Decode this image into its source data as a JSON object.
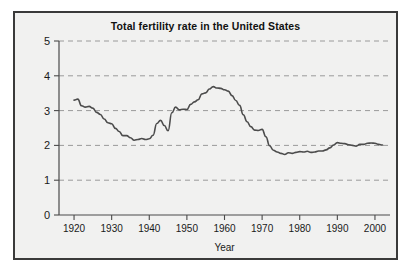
{
  "figure": {
    "title": "Total fertility rate in the United States",
    "background_color": "#f1f1f0",
    "border_color": "#3a3a3a",
    "line_color": "#4c4c4c",
    "grid_color": "#9a9a9a"
  },
  "chart_data": {
    "type": "line",
    "title": "Total fertility rate in the United States",
    "xlabel": "Year",
    "ylabel": "",
    "xlim": [
      1916,
      2004
    ],
    "ylim": [
      0,
      5
    ],
    "grid": true,
    "legend": "none",
    "xticks": [
      1920,
      1930,
      1940,
      1950,
      1960,
      1970,
      1980,
      1990,
      2000
    ],
    "xtick_labels": [
      "1920",
      "1930",
      "1940",
      "1950",
      "1960",
      "1970",
      "1980",
      "1990",
      "2000"
    ],
    "yticks": [
      0,
      1,
      2,
      3,
      4,
      5
    ],
    "ytick_labels": [
      "0",
      "1",
      "2",
      "3",
      "4",
      "5"
    ],
    "series": [
      {
        "name": "Total fertility rate",
        "x": [
          1920,
          1921,
          1922,
          1923,
          1924,
          1925,
          1926,
          1927,
          1928,
          1929,
          1930,
          1931,
          1932,
          1933,
          1934,
          1935,
          1936,
          1937,
          1938,
          1939,
          1940,
          1941,
          1942,
          1943,
          1944,
          1945,
          1946,
          1947,
          1948,
          1949,
          1950,
          1951,
          1952,
          1953,
          1954,
          1955,
          1956,
          1957,
          1958,
          1959,
          1960,
          1961,
          1962,
          1963,
          1964,
          1965,
          1966,
          1967,
          1968,
          1969,
          1970,
          1971,
          1972,
          1973,
          1974,
          1975,
          1976,
          1977,
          1978,
          1979,
          1980,
          1981,
          1982,
          1983,
          1984,
          1985,
          1986,
          1987,
          1988,
          1989,
          1990,
          1991,
          1992,
          1993,
          1994,
          1995,
          1996,
          1997,
          1998,
          1999,
          2000,
          2001,
          2002
        ],
        "values": [
          3.3,
          3.33,
          3.14,
          3.1,
          3.12,
          3.07,
          2.95,
          2.89,
          2.76,
          2.65,
          2.62,
          2.49,
          2.4,
          2.28,
          2.28,
          2.22,
          2.15,
          2.17,
          2.2,
          2.17,
          2.19,
          2.29,
          2.63,
          2.72,
          2.57,
          2.42,
          2.94,
          3.1,
          3.02,
          3.04,
          3.03,
          3.18,
          3.25,
          3.31,
          3.48,
          3.51,
          3.62,
          3.69,
          3.65,
          3.64,
          3.6,
          3.56,
          3.43,
          3.29,
          3.15,
          2.88,
          2.68,
          2.54,
          2.44,
          2.43,
          2.46,
          2.25,
          1.99,
          1.86,
          1.81,
          1.77,
          1.74,
          1.79,
          1.77,
          1.8,
          1.82,
          1.81,
          1.83,
          1.8,
          1.81,
          1.84,
          1.84,
          1.87,
          1.93,
          2.01,
          2.08,
          2.06,
          2.05,
          2.02,
          2.0,
          1.98,
          2.03,
          2.03,
          2.06,
          2.07,
          2.06,
          2.03,
          2.01
        ]
      }
    ]
  },
  "axes": {
    "x_axis_title": "Year"
  }
}
